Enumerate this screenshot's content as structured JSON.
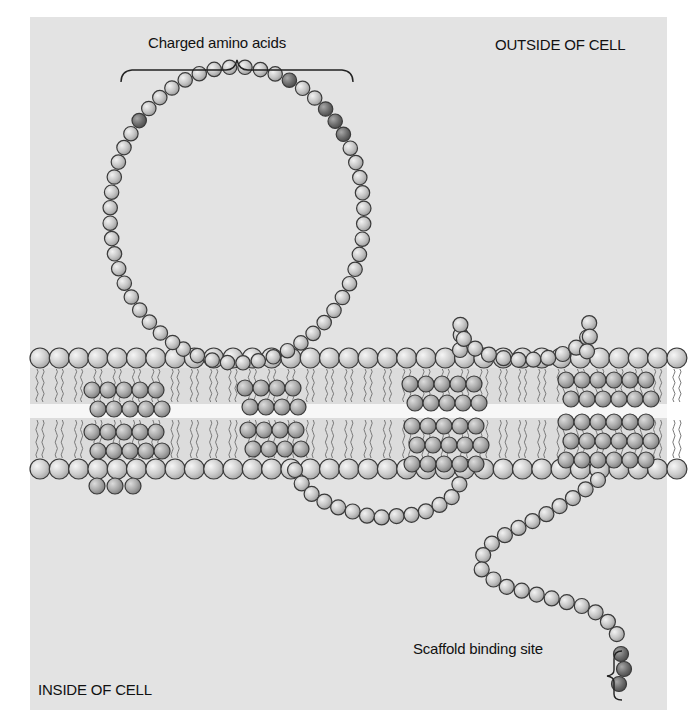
{
  "figure": {
    "background": "#e3e3e3",
    "labels": {
      "charged_amino_acids": "Charged amino acids",
      "outside_of_cell": "OUTSIDE OF CELL",
      "inside_of_cell": "INSIDE OF CELL",
      "scaffold_binding_site": "Scaffold binding site"
    },
    "colors": {
      "residue_light": "#c4c4c4",
      "residue_mid": "#a9a9a9",
      "residue_charged": "#6e6e6e",
      "residue_outline": "#3a3a3a",
      "lipid_head": "#cfcfcf",
      "lipid_tail": "#777777",
      "bilayer_core": "#f4f4f4"
    },
    "membrane": {
      "outer_head_y": 358,
      "inner_head_y": 469,
      "head_radius": 10,
      "head_spacing": 19.3,
      "x_start": 40,
      "x_end": 690
    },
    "structure": {
      "transmembrane_helices": 4,
      "extracellular_loops": 2,
      "intracellular_loops": 1,
      "charged_residues_in_top_loop": 5,
      "scaffold_binding_residues": 3
    }
  }
}
